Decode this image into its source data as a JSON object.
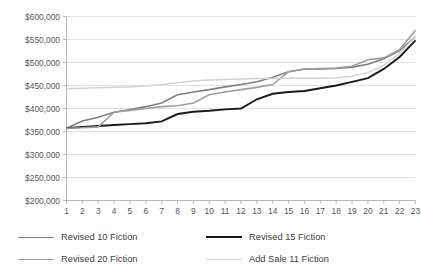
{
  "chart_data": {
    "type": "line",
    "title": "",
    "xlabel": "",
    "ylabel": "",
    "grid": true,
    "legend_position": "bottom",
    "ylim": [
      200000,
      600000
    ],
    "ytick_interval": 50000,
    "ytick_labels": [
      "$600,000",
      "$550,000",
      "$500,000",
      "$450,000",
      "$400,000",
      "$350,000",
      "$300,000",
      "$250,000",
      "$200,000"
    ],
    "ytick_values": [
      600000,
      550000,
      500000,
      450000,
      400000,
      350000,
      300000,
      250000,
      200000
    ],
    "x": [
      1,
      2,
      3,
      4,
      5,
      6,
      7,
      8,
      9,
      10,
      11,
      12,
      13,
      14,
      15,
      16,
      17,
      18,
      19,
      20,
      21,
      22,
      23
    ],
    "xtick_labels": [
      "1",
      "2",
      "3",
      "4",
      "5",
      "6",
      "7",
      "8",
      "9",
      "10",
      "11",
      "12",
      "13",
      "14",
      "15",
      "16",
      "17",
      "18",
      "19",
      "20",
      "21",
      "22",
      "23"
    ],
    "series": [
      {
        "name": "Revised 10 Fiction",
        "color": "#7f7f7f",
        "width": 1.6,
        "values": [
          357000,
          373000,
          381000,
          392000,
          398000,
          404000,
          412000,
          430000,
          436000,
          441000,
          447000,
          452000,
          458000,
          468000,
          480000,
          486000,
          486000,
          487000,
          490000,
          496000,
          508000,
          526000,
          556000
        ]
      },
      {
        "name": "Revised 15 Fiction",
        "color": "#1a1a1a",
        "width": 1.9,
        "values": [
          357000,
          360000,
          362000,
          364000,
          366000,
          368000,
          372000,
          388000,
          393000,
          395000,
          398000,
          400000,
          420000,
          432000,
          436000,
          438000,
          444000,
          450000,
          458000,
          466000,
          486000,
          512000,
          548000
        ]
      },
      {
        "name": "Revised 20 Fiction",
        "color": "#9e9e9e",
        "width": 1.6,
        "values": [
          357000,
          358000,
          360000,
          392000,
          396000,
          400000,
          404000,
          406000,
          412000,
          430000,
          436000,
          441000,
          446000,
          452000,
          480000,
          486000,
          487000,
          488000,
          492000,
          506000,
          510000,
          528000,
          570000
        ]
      },
      {
        "name": "Add Sale 11 Fiction",
        "color": "#d2d2d2",
        "width": 1.5,
        "values": [
          443000,
          444000,
          445000,
          446000,
          447000,
          449000,
          452000,
          456000,
          460000,
          462000,
          463000,
          464000,
          465000,
          465000,
          466000,
          466000,
          466000,
          467000,
          470000,
          478000,
          494000,
          520000,
          556000
        ]
      }
    ]
  },
  "legend": {
    "items": [
      {
        "label": "Revised 10 Fiction",
        "color": "#7f7f7f",
        "width": 1.6
      },
      {
        "label": "Revised 15 Fiction",
        "color": "#1a1a1a",
        "width": 2.2
      },
      {
        "label": "Revised 20 Fiction",
        "color": "#9e9e9e",
        "width": 1.6
      },
      {
        "label": "Add Sale 11 Fiction",
        "color": "#d2d2d2",
        "width": 1.6
      }
    ]
  }
}
